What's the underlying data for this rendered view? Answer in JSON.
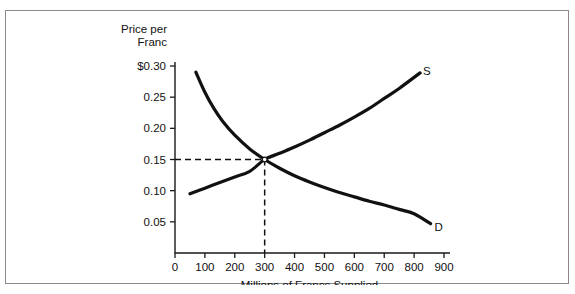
{
  "chart_data": {
    "type": "line",
    "title": "",
    "xlabel": "Millions of Francs Supplied",
    "ylabel_line1": "Price per",
    "ylabel_line2": "Franc",
    "xlim": [
      0,
      900
    ],
    "ylim": [
      0,
      0.3
    ],
    "grid": false,
    "legend_position": "curve-end-labels",
    "xticks": [
      0,
      100,
      200,
      300,
      400,
      500,
      600,
      700,
      800,
      900
    ],
    "xtick_labels": [
      "0",
      "100",
      "200",
      "300",
      "400",
      "500",
      "600",
      "700",
      "800",
      "900"
    ],
    "yticks": [
      0.05,
      0.1,
      0.15,
      0.2,
      0.25,
      0.3
    ],
    "ytick_labels": [
      "0.05",
      "0.10",
      "0.15",
      "0.20",
      "0.25",
      "$0.30"
    ],
    "series": [
      {
        "name": "S",
        "label": "S",
        "label_x": 830,
        "label_y": 0.292,
        "description": "Supply curve, upward sloping",
        "x": [
          50,
          100,
          150,
          200,
          250,
          300,
          350,
          400,
          450,
          500,
          550,
          600,
          650,
          700,
          750,
          820
        ],
        "y": [
          0.095,
          0.104,
          0.113,
          0.122,
          0.131,
          0.15,
          0.16,
          0.17,
          0.181,
          0.193,
          0.205,
          0.218,
          0.232,
          0.248,
          0.264,
          0.289
        ]
      },
      {
        "name": "D",
        "label": "D",
        "label_x": 868,
        "label_y": 0.042,
        "description": "Demand curve, downward sloping convex",
        "x": [
          70,
          100,
          130,
          160,
          200,
          250,
          300,
          350,
          400,
          450,
          500,
          550,
          600,
          650,
          700,
          750,
          800,
          855
        ],
        "y": [
          0.29,
          0.258,
          0.232,
          0.211,
          0.189,
          0.167,
          0.15,
          0.136,
          0.124,
          0.114,
          0.105,
          0.097,
          0.09,
          0.083,
          0.077,
          0.07,
          0.063,
          0.047
        ]
      }
    ],
    "annotations": {
      "equilibrium": {
        "label": "equilibrium",
        "x": 300,
        "y": 0.15,
        "guide_horizontal": true,
        "guide_vertical": true
      }
    }
  }
}
